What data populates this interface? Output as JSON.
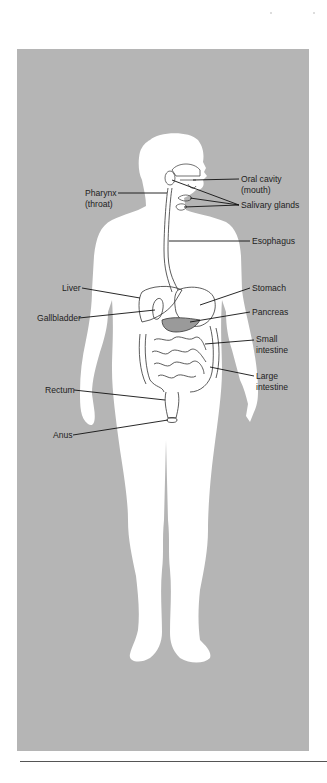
{
  "diagram": {
    "background_color": "#b5b5b5",
    "silhouette_color": "#ffffff",
    "line_color": "#1a1a1a",
    "labels": {
      "oral_cavity": {
        "line1": "Oral cavity",
        "line2": "(mouth)"
      },
      "pharynx": {
        "line1": "Pharynx",
        "line2": "(throat)"
      },
      "salivary_glands": {
        "line1": "Salivary glands"
      },
      "esophagus": {
        "line1": "Esophagus"
      },
      "liver": {
        "line1": "Liver"
      },
      "gallbladder": {
        "line1": "Gallbladder"
      },
      "stomach": {
        "line1": "Stomach"
      },
      "pancreas": {
        "line1": "Pancreas"
      },
      "small_intestine": {
        "line1": "Small",
        "line2": "intestine"
      },
      "large_intestine": {
        "line1": "Large",
        "line2": "intestine"
      },
      "rectum": {
        "line1": "Rectum"
      },
      "anus": {
        "line1": "Anus"
      }
    }
  }
}
